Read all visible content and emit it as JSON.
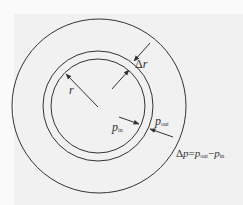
{
  "diagram": {
    "colors": {
      "line": "#333333",
      "background": "#f1f1f1"
    },
    "geometry": {
      "center": [
        98,
        106
      ],
      "outer_circle_radius": 87,
      "shell_outer_radius": 55,
      "shell_inner_radius": 47
    },
    "labels": {
      "radius": "r",
      "thickness_delta": "Δ",
      "thickness_var": "r",
      "p_in_main": "p",
      "p_in_sub": "in",
      "p_out_main": "p",
      "p_out_sub": "out",
      "equation_delta": "Δ",
      "equation_p": "p",
      "equation_eq": "=",
      "equation_p1": "p",
      "equation_p1_sub": "out",
      "equation_minus": "−",
      "equation_p2": "p",
      "equation_p2_sub": "in"
    },
    "arrows": [
      {
        "name": "radius-arrow",
        "from": [
          98,
          107
        ],
        "to": [
          66,
          74
        ]
      },
      {
        "name": "delta-r-outer-arrow",
        "from": [
          150,
          43
        ],
        "to": [
          134,
          61
        ]
      },
      {
        "name": "delta-r-inner-arrow",
        "from": [
          112,
          89
        ],
        "to": [
          129,
          70
        ]
      },
      {
        "name": "p-in-arrow",
        "from": [
          119,
          117
        ],
        "to": [
          139,
          124
        ]
      },
      {
        "name": "p-out-arrow",
        "from": [
          173,
          137
        ],
        "to": [
          150,
          129
        ]
      }
    ]
  }
}
